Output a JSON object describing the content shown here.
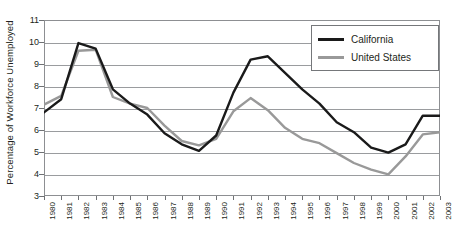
{
  "chart_data": {
    "type": "line",
    "title": "",
    "xlabel": "",
    "ylabel": "Percentage of Workforce Unemployed",
    "ylim": [
      3,
      11
    ],
    "yticks": [
      3,
      4,
      5,
      6,
      7,
      8,
      9,
      10,
      11
    ],
    "grid": true,
    "legend_position": "top-right",
    "categories": [
      "1980",
      "1981",
      "1982",
      "1983",
      "1984",
      "1985",
      "1986",
      "1987",
      "1988",
      "1989",
      "1990",
      "1991",
      "1992",
      "1993",
      "1994",
      "1995",
      "1996",
      "1997",
      "1998",
      "1999",
      "2000",
      "2001",
      "2002",
      "2003"
    ],
    "series": [
      {
        "name": "California",
        "color": "#1a1a1a",
        "values": [
          6.8,
          7.4,
          9.95,
          9.7,
          7.85,
          7.2,
          6.7,
          5.85,
          5.35,
          5.05,
          5.75,
          7.7,
          9.2,
          9.35,
          8.6,
          7.85,
          7.2,
          6.35,
          5.9,
          5.2,
          4.97,
          5.35,
          6.65,
          6.65
        ]
      },
      {
        "name": "United States",
        "color": "#999999",
        "values": [
          7.15,
          7.55,
          9.6,
          9.65,
          7.5,
          7.2,
          7.0,
          6.2,
          5.5,
          5.3,
          5.6,
          6.85,
          7.45,
          6.9,
          6.1,
          5.6,
          5.4,
          4.95,
          4.5,
          4.2,
          3.98,
          4.8,
          5.8,
          5.9
        ]
      }
    ]
  },
  "legend": {
    "items": [
      {
        "label": "California",
        "color": "#1a1a1a"
      },
      {
        "label": "United States",
        "color": "#999999"
      }
    ]
  },
  "colors": {
    "california": "#1a1a1a",
    "united_states": "#999999",
    "gridline": "#9a9c9f",
    "frame": "#8d8f92",
    "text": "#231f20",
    "background": "#ffffff"
  }
}
